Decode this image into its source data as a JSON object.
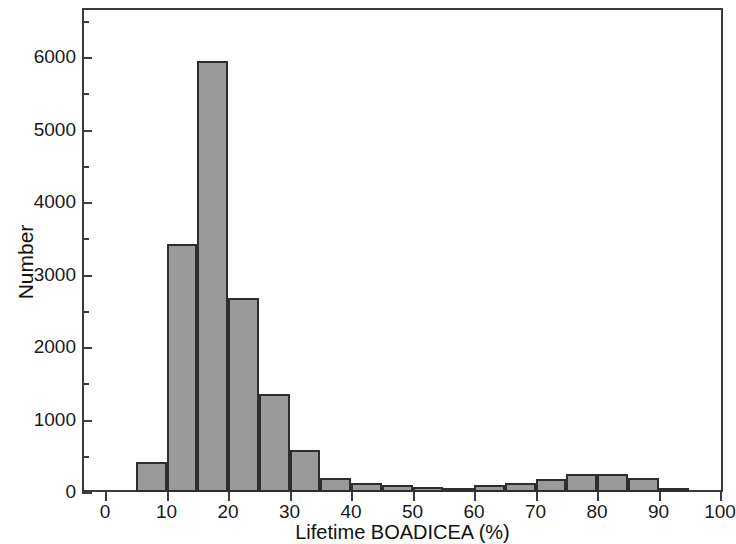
{
  "chart_data": {
    "type": "bar",
    "title": "",
    "subtitle": "",
    "xlabel": "Lifetime BOADICEA (%)",
    "ylabel": "Number",
    "xlim": [
      -2,
      102
    ],
    "ylim": [
      0,
      6500
    ],
    "grid": false,
    "legend": null,
    "bin_width": 5,
    "bar_color": "#9a9a9a",
    "bar_edge_color": "#2e2e2e",
    "xticks": [
      0,
      10,
      20,
      30,
      40,
      50,
      60,
      70,
      80,
      90,
      100
    ],
    "xtick_labels": [
      "0",
      "10",
      "20",
      "30",
      "40",
      "50",
      "60",
      "70",
      "80",
      "90",
      "100"
    ],
    "yticks": [
      0,
      1000,
      2000,
      3000,
      4000,
      5000,
      6000
    ],
    "ytick_labels": [
      "0",
      "1000",
      "2000",
      "3000",
      "4000",
      "5000",
      "6000"
    ],
    "yticks_minor": [
      500,
      1500,
      2500,
      3500,
      4500,
      5500,
      6500
    ],
    "bins": [
      {
        "start": 5,
        "end": 10,
        "value": 420
      },
      {
        "start": 10,
        "end": 15,
        "value": 3420
      },
      {
        "start": 15,
        "end": 20,
        "value": 5950
      },
      {
        "start": 20,
        "end": 25,
        "value": 2680
      },
      {
        "start": 25,
        "end": 30,
        "value": 1350
      },
      {
        "start": 30,
        "end": 35,
        "value": 580
      },
      {
        "start": 35,
        "end": 40,
        "value": 200
      },
      {
        "start": 40,
        "end": 45,
        "value": 130
      },
      {
        "start": 45,
        "end": 50,
        "value": 90
      },
      {
        "start": 50,
        "end": 55,
        "value": 70
      },
      {
        "start": 55,
        "end": 60,
        "value": 35
      },
      {
        "start": 60,
        "end": 65,
        "value": 90
      },
      {
        "start": 65,
        "end": 70,
        "value": 120
      },
      {
        "start": 70,
        "end": 75,
        "value": 180
      },
      {
        "start": 75,
        "end": 80,
        "value": 250
      },
      {
        "start": 80,
        "end": 85,
        "value": 250
      },
      {
        "start": 85,
        "end": 90,
        "value": 200
      },
      {
        "start": 90,
        "end": 95,
        "value": 60
      }
    ],
    "categories": [
      "5-10",
      "10-15",
      "15-20",
      "20-25",
      "25-30",
      "30-35",
      "35-40",
      "40-45",
      "45-50",
      "50-55",
      "55-60",
      "60-65",
      "65-70",
      "70-75",
      "75-80",
      "80-85",
      "85-90",
      "90-95"
    ],
    "values": [
      420,
      3420,
      5950,
      2680,
      1350,
      580,
      200,
      130,
      90,
      70,
      35,
      90,
      120,
      180,
      250,
      250,
      200,
      60
    ]
  }
}
